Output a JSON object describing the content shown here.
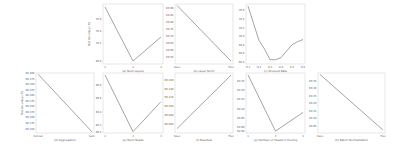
{
  "figure": {
    "line_color": "#9a9a9a",
    "frame_color": "#d8d8d8",
    "ylabel": "Test Accuracy (%)"
  },
  "chart_data": [
    {
      "type": "line",
      "title": "",
      "xlabel": "(a) Num Layers",
      "ylabel": "Test Accuracy (%)",
      "categories": [
        "1",
        "2",
        "3"
      ],
      "values": [
        70.8,
        69.9,
        70.3
      ],
      "yticks": [
        "69.9",
        "70.2",
        "70.4",
        "70.6"
      ],
      "ylim": [
        69.85,
        70.85
      ],
      "grid": false,
      "legend": null
    },
    {
      "type": "line",
      "title": "",
      "xlabel": "(b) Layer Norm",
      "ylabel": "",
      "categories": [
        "False",
        "True"
      ],
      "values": [
        69.92,
        69.52
      ],
      "yticks": [
        "69.55",
        "69.60",
        "69.65",
        "69.70",
        "69.75",
        "69.80",
        "69.85",
        "69.90"
      ],
      "ylim": [
        69.5,
        69.93
      ],
      "grid": false,
      "legend": null
    },
    {
      "type": "line",
      "title": "",
      "xlabel": "(c) Dropout Rate",
      "ylabel": "",
      "x": [
        0.1,
        0.15,
        0.2,
        0.25,
        0.3,
        0.35,
        0.4,
        0.45,
        0.5,
        0.55,
        0.6
      ],
      "values": [
        70.7,
        70.3,
        69.9,
        69.7,
        69.45,
        69.45,
        69.5,
        69.65,
        69.8,
        69.87,
        69.92
      ],
      "xticks": [
        "0.1",
        "0.2",
        "0.3",
        "0.4",
        "0.5",
        "0.6"
      ],
      "yticks": [
        "69.4",
        "69.6",
        "69.8",
        "70.0",
        "70.2",
        "70.4",
        "70.6"
      ],
      "ylim": [
        69.35,
        70.75
      ],
      "grid": false,
      "legend": null
    },
    {
      "type": "line",
      "title": "",
      "xlabel": "(d) Aggregation",
      "ylabel": "Test Accuracy (%)",
      "categories": [
        "Concat",
        "Sum"
      ],
      "values": [
        69.395,
        69.135
      ],
      "yticks": [
        "69.150",
        "69.175",
        "69.200",
        "69.225",
        "69.250",
        "69.275",
        "69.300",
        "69.325",
        "69.350",
        "69.375",
        "69.400"
      ],
      "ylim": [
        69.13,
        69.4
      ],
      "grid": false,
      "legend": null
    },
    {
      "type": "line",
      "title": "",
      "xlabel": "(e) Num Heads",
      "ylabel": "",
      "categories": [
        "1",
        "2",
        "3"
      ],
      "values": [
        69.95,
        69.1,
        69.55
      ],
      "yticks": [
        "69.1",
        "69.2",
        "69.4",
        "69.6",
        "69.8"
      ],
      "ylim": [
        69.08,
        69.98
      ],
      "grid": false,
      "legend": null
    },
    {
      "type": "line",
      "title": "",
      "xlabel": "(f) Residual",
      "ylabel": "",
      "categories": [
        "False",
        "True"
      ],
      "values": [
        69.05,
        69.17
      ],
      "yticks": [
        "69.060",
        "69.080",
        "69.100",
        "69.120",
        "69.140",
        "69.160"
      ],
      "ylim": [
        69.04,
        69.175
      ],
      "grid": false,
      "legend": null
    },
    {
      "type": "line",
      "title": "",
      "xlabel": "(g) Number of Heads in Pooling",
      "ylabel": "",
      "categories": [
        "1",
        "2",
        "3"
      ],
      "values": [
        69.28,
        68.98,
        69.08
      ],
      "yticks": [
        "68.98",
        "69.00",
        "69.05",
        "69.10",
        "69.15",
        "69.20",
        "69.25"
      ],
      "ylim": [
        68.97,
        69.29
      ],
      "grid": false,
      "legend": null
    },
    {
      "type": "line",
      "title": "",
      "xlabel": "(h) Batch Normalization",
      "ylabel": "",
      "categories": [
        "False",
        "True"
      ],
      "values": [
        69.39,
        69.02
      ],
      "yticks": [
        "69.05",
        "69.10",
        "69.15",
        "69.20",
        "69.25",
        "69.30",
        "69.35"
      ],
      "ylim": [
        69.0,
        69.4
      ],
      "grid": false,
      "legend": null
    }
  ],
  "panels_layout": [
    {
      "x": 103,
      "y": 4,
      "w": 60,
      "h": 60
    },
    {
      "x": 175,
      "y": 4,
      "w": 58,
      "h": 60
    },
    {
      "x": 246,
      "y": 4,
      "w": 59,
      "h": 60
    },
    {
      "x": 36,
      "y": 73,
      "w": 58,
      "h": 60
    },
    {
      "x": 103,
      "y": 73,
      "w": 60,
      "h": 60
    },
    {
      "x": 175,
      "y": 73,
      "w": 58,
      "h": 60
    },
    {
      "x": 246,
      "y": 73,
      "w": 59,
      "h": 60
    },
    {
      "x": 318,
      "y": 73,
      "w": 67,
      "h": 60
    }
  ]
}
